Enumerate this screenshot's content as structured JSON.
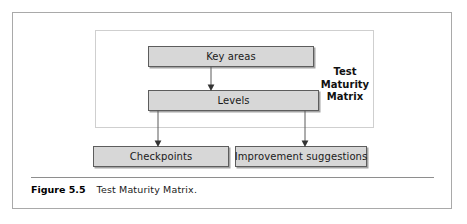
{
  "figure": {
    "caption_number": "Figure 5.5",
    "caption_text": "Test Maturity Matrix."
  },
  "diagram": {
    "type": "flowchart",
    "group_label": {
      "line1": "Test",
      "line2": "Maturity",
      "line3": "Matrix"
    },
    "nodes": [
      {
        "id": "key-areas",
        "label": "Key areas"
      },
      {
        "id": "levels",
        "label": "Levels"
      },
      {
        "id": "checkpoints",
        "label": "Checkpoints"
      },
      {
        "id": "improvement-suggestions",
        "label": "Improvement suggestions"
      }
    ],
    "edges": [
      {
        "from": "key-areas",
        "to": "levels"
      },
      {
        "from": "levels",
        "to": "checkpoints"
      },
      {
        "from": "levels",
        "to": "improvement-suggestions"
      }
    ],
    "colors": {
      "node_fill": "#d7d7d7",
      "node_border": "#5d5d5d",
      "group_border": "#cfcfcf",
      "frame_border": "#a9a9a9",
      "connector": "#4a4a4a",
      "text": "#1a1a1a",
      "background": "#ffffff"
    }
  }
}
